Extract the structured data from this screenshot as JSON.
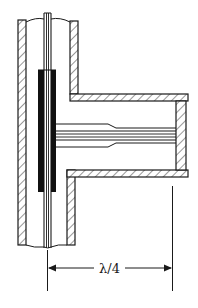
{
  "diagram": {
    "type": "coaxial tee junction with quarter-wave shorted stub",
    "dimension_label": "λ/4",
    "colors": {
      "ink": "#1a1a1a",
      "background": "#ffffff"
    },
    "components": [
      {
        "id": "main-coax-outer",
        "description": "Vertical coaxial outer conductor with hatched walls"
      },
      {
        "id": "main-inner-conductor",
        "description": "Center conductor running vertically"
      },
      {
        "id": "sleeve",
        "description": "Dark thickened sleeve on inner conductor at junction"
      },
      {
        "id": "side-arm",
        "description": "Horizontal branch with hatched walls"
      },
      {
        "id": "side-arm-inner",
        "description": "Stub inner conductor, tapered, ending at shorted wall"
      },
      {
        "id": "short-wall",
        "description": "Shorting end wall of side arm"
      },
      {
        "id": "dimension",
        "description": "Quarter-wavelength distance from main line axis to short"
      }
    ]
  }
}
